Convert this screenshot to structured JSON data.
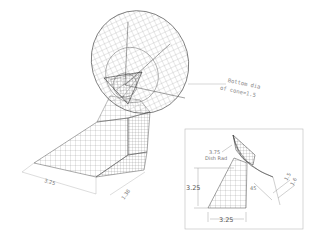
{
  "drawing": {
    "title": "Isometric wireframe of cone and dish on tapered base",
    "annotation": {
      "line1": "Bottom dia",
      "line2": "of cone=1.5"
    },
    "base_dims": {
      "width": "3.25",
      "depth": "1.38"
    }
  },
  "detail_view": {
    "leader_note": {
      "line1": "3.75",
      "line2": "Dish Rad"
    },
    "dims": {
      "height": "3.25",
      "width": "3.25",
      "angle": "45",
      "d1": "1.5",
      "d2": "1.6"
    }
  },
  "colors": {
    "line": "#555555",
    "frame": "#bbbbbb",
    "dim": "#888888"
  }
}
